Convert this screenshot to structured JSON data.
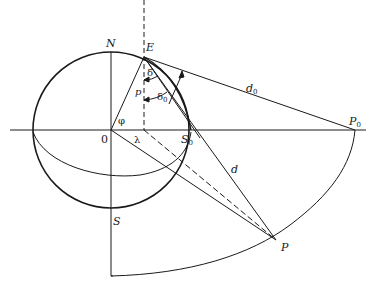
{
  "diagram": {
    "type": "geometric-projection",
    "colors": {
      "ink": "#1a1a1a",
      "background": "#ffffff"
    },
    "points": {
      "N": {
        "label": "N",
        "x": 111,
        "y": 52
      },
      "E": {
        "label": "E",
        "x": 144,
        "y": 57
      },
      "O": {
        "label": "0",
        "x": 111,
        "y": 130
      },
      "S0": {
        "label": "S",
        "sub": "0",
        "x": 191,
        "y": 130
      },
      "P0": {
        "label": "P",
        "sub": "0",
        "x": 355,
        "y": 130
      },
      "S": {
        "label": "S",
        "x": 111,
        "y": 208
      },
      "P": {
        "label": "P",
        "x": 276,
        "y": 240
      }
    },
    "angles": {
      "phi": "φ",
      "lambda": "λ",
      "delta": "δ",
      "delta0": {
        "label": "δ",
        "sub": "0"
      },
      "p": "p"
    },
    "distances": {
      "d0": {
        "label": "d",
        "sub": "0"
      },
      "d": "d"
    }
  }
}
